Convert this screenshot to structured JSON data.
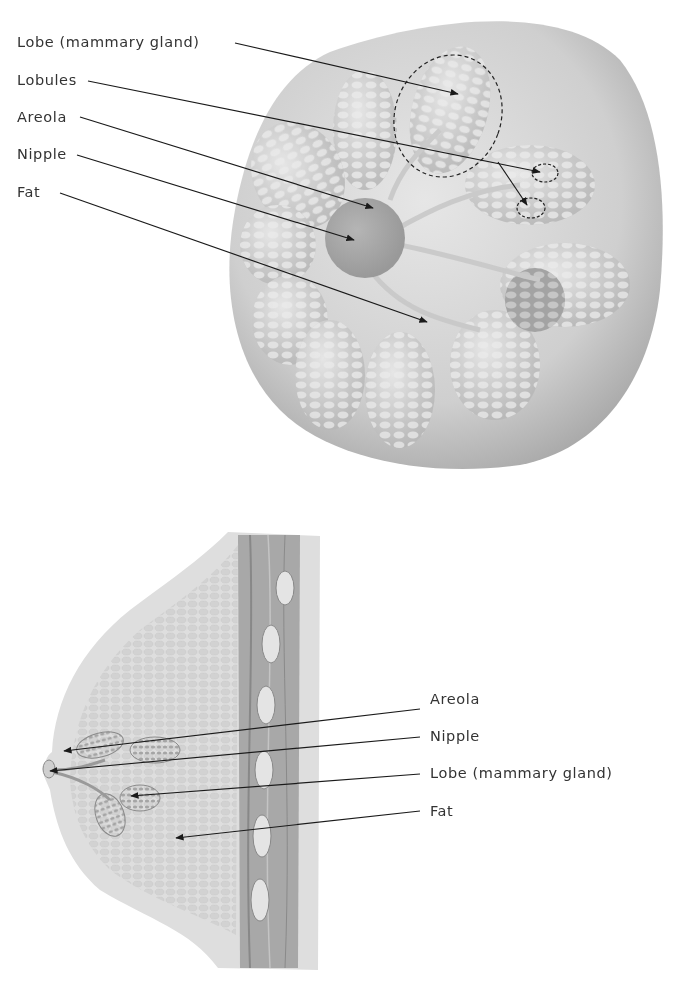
{
  "top_diagram": {
    "view": "front view (internal structure)",
    "labels": [
      {
        "id": "lobe",
        "text": "Lobe (mammary gland)"
      },
      {
        "id": "lobules",
        "text": "Lobules"
      },
      {
        "id": "areola",
        "text": "Areola"
      },
      {
        "id": "nipple",
        "text": "Nipple"
      },
      {
        "id": "fat",
        "text": "Fat"
      }
    ]
  },
  "bottom_diagram": {
    "view": "side cross-section",
    "labels": [
      {
        "id": "areola",
        "text": "Areola"
      },
      {
        "id": "nipple",
        "text": "Nipple"
      },
      {
        "id": "lobe",
        "text": "Lobe (mammary gland)"
      },
      {
        "id": "fat",
        "text": "Fat"
      }
    ]
  },
  "colors": {
    "background": "#ffffff",
    "label_text": "#333333",
    "leader_line": "#1a1a1a",
    "tissue_light": "#d9d9d9",
    "tissue_mid": "#bdbdbd",
    "tissue_dark": "#8f8f8f"
  }
}
